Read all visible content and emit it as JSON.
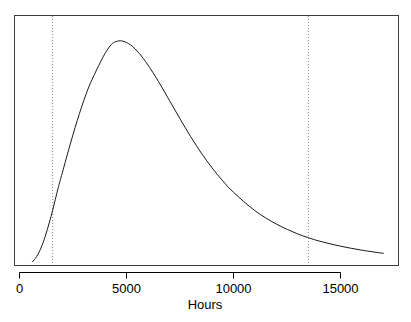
{
  "chart_data": {
    "type": "line",
    "title": "",
    "subtitle": "",
    "xlabel": "Hours",
    "ylabel": "",
    "xlim": [
      -500,
      17800
    ],
    "ylim": [
      0,
      1.08
    ],
    "grid": false,
    "legend": null,
    "legend_position": "none",
    "xticks": [
      0,
      5000,
      10000,
      15000
    ],
    "xtick_labels": [
      "0",
      "5000",
      "10000",
      "15000"
    ],
    "yticks": [],
    "ytick_labels": [],
    "series": [
      {
        "name": "density",
        "type": "line",
        "color": "#1a1a1a",
        "linewidth": 1,
        "x": [
          600,
          800,
          1000,
          1200,
          1400,
          1550,
          1800,
          2000,
          2400,
          2800,
          3200,
          3600,
          4000,
          4300,
          4500,
          4800,
          5200,
          5600,
          6000,
          6500,
          7000,
          7500,
          8000,
          8500,
          9000,
          9500,
          10000,
          11000,
          12000,
          13000,
          13500,
          14000,
          15000,
          16000,
          17000
        ],
        "y": [
          0.012,
          0.035,
          0.073,
          0.125,
          0.19,
          0.243,
          0.34,
          0.41,
          0.548,
          0.675,
          0.785,
          0.87,
          0.945,
          0.985,
          0.997,
          1.0,
          0.982,
          0.944,
          0.893,
          0.818,
          0.735,
          0.652,
          0.572,
          0.498,
          0.432,
          0.374,
          0.323,
          0.241,
          0.181,
          0.137,
          0.12,
          0.105,
          0.082,
          0.064,
          0.05
        ]
      }
    ],
    "annotations": [
      {
        "name": "lower-reference-line",
        "type": "vline",
        "x": 1550,
        "style": "dotted",
        "color": "#8a8a8a",
        "label": ""
      },
      {
        "name": "upper-reference-line",
        "type": "vline",
        "x": 13500,
        "style": "dotted",
        "color": "#8a8a8a",
        "label": ""
      }
    ],
    "axes_box": {
      "stroke": "#3c3c3c",
      "fill": "#ffffff"
    }
  },
  "axis": {
    "x_title": "Hours",
    "tick_labels": [
      "0",
      "5000",
      "10000",
      "15000"
    ]
  },
  "colors": {
    "curve": "#1a1a1a",
    "reference_line": "#8a8a8a",
    "frame": "#3c3c3c",
    "background": "#ffffff",
    "text": "#000000"
  }
}
